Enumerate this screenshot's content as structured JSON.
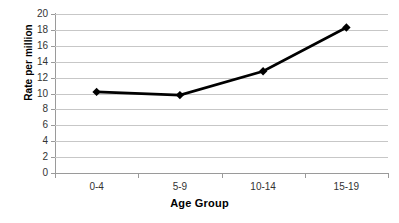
{
  "chart_data": {
    "type": "line",
    "title": "",
    "subtitle": "",
    "xlabel": "Age Group",
    "ylabel": "Rate per million",
    "categories": [
      "0-4",
      "5-9",
      "10-14",
      "15-19"
    ],
    "values": [
      10.2,
      9.8,
      12.8,
      18.3
    ],
    "series": [
      {
        "name": "Rate per million",
        "values": [
          10.2,
          9.8,
          12.8,
          18.3
        ]
      }
    ],
    "ylim": [
      0,
      20
    ],
    "ytick_values": [
      0,
      2,
      4,
      6,
      8,
      10,
      12,
      14,
      16,
      18,
      20
    ],
    "ytick_labels": [
      "0",
      "2",
      "4",
      "6",
      "8",
      "10",
      "12",
      "14",
      "16",
      "18",
      "20"
    ],
    "grid": true,
    "grid_axis": "y",
    "legend": false,
    "legend_position": "none",
    "marker": "diamond",
    "line_color": "#000000",
    "marker_color": "#000000",
    "grid_color": "#c7c7c7",
    "axis_color": "#9a9a9a",
    "background_color": "#ffffff",
    "annotations": []
  }
}
